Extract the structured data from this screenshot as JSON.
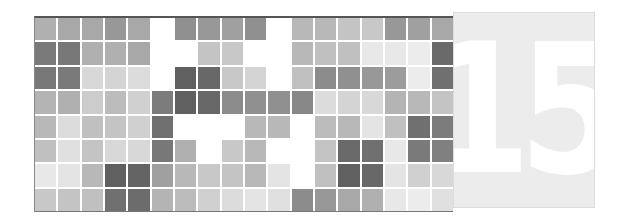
{
  "mosaic": {
    "rows": 8,
    "cols": 18,
    "cells": [
      [
        "#b0b0b0",
        "#a8a8a8",
        "#a8a8a8",
        "#989898",
        "#a8a8a8",
        "#ffffff",
        "#909090",
        "#989898",
        "#a0a0a0",
        "#909090",
        "#ffffff",
        "#b8b8b8",
        "#b8b8b8",
        "#c4c4c4",
        "#c8c8c8",
        "#989898",
        "#a0a0a0",
        "#a8a8a8"
      ],
      [
        "#7a7a7a",
        "#787878",
        "#b0b0b0",
        "#b0b0b0",
        "#a8a8a8",
        "#ffffff",
        "#ffffff",
        "#c4c4c4",
        "#c8c8c8",
        "#ffffff",
        "#ffffff",
        "#b8b8b8",
        "#c0c0c0",
        "#c0c0c0",
        "#e8e8e8",
        "#e8e8e8",
        "#ececec",
        "#6a6a6a"
      ],
      [
        "#787878",
        "#7a7a7a",
        "#d8d8d8",
        "#d4d4d4",
        "#dcdcdc",
        "#ffffff",
        "#606060",
        "#686868",
        "#c8c8c8",
        "#d4d4d4",
        "#ffffff",
        "#c0c0c0",
        "#8c8c8c",
        "#909090",
        "#989898",
        "#9c9c9c",
        "#ececec",
        "#707070"
      ],
      [
        "#b4b4b4",
        "#b0b0b0",
        "#cccccc",
        "#bcbcbc",
        "#d0d0d0",
        "#7c7c7c",
        "#606060",
        "#686868",
        "#8c8c8c",
        "#909090",
        "#909090",
        "#888888",
        "#dcdcdc",
        "#d4d4d4",
        "#d8d8d8",
        "#b4b4b4",
        "#b8b8b8",
        "#c4c4c4"
      ],
      [
        "#b8b8b8",
        "#dcdcdc",
        "#c0c0c0",
        "#c4c4c4",
        "#d0d0d0",
        "#707070",
        "#ffffff",
        "#ffffff",
        "#ffffff",
        "#b8b8b8",
        "#b8b8b8",
        "#ffffff",
        "#bcbcbc",
        "#b8b8b8",
        "#e4e4e4",
        "#c0c0c0",
        "#707070",
        "#7c7c7c"
      ],
      [
        "#c0c0c0",
        "#e0e0e0",
        "#c4c4c4",
        "#d8d8d8",
        "#d8d8d8",
        "#787878",
        "#b0b0b0",
        "#ffffff",
        "#c8c8c8",
        "#b8b8b8",
        "#ffffff",
        "#ffffff",
        "#c4c4c4",
        "#6a6a6a",
        "#707070",
        "#e8e8e8",
        "#7a7a7a",
        "#808080"
      ],
      [
        "#e8e8e8",
        "#e4e4e4",
        "#b8b8b8",
        "#606060",
        "#646464",
        "#a0a0a0",
        "#b8b8b8",
        "#c8c8c8",
        "#c4c4c4",
        "#b8b8b8",
        "#e4e4e4",
        "#ffffff",
        "#c0c0c0",
        "#606060",
        "#686868",
        "#e4e4e4",
        "#d0d0d0",
        "#d8d8d8"
      ],
      [
        "#c8c8c8",
        "#c4c4c4",
        "#c0c0c0",
        "#707070",
        "#6c6c6c",
        "#b4b4b4",
        "#bcbcbc",
        "#d0d0d0",
        "#dcdcdc",
        "#e4e4e4",
        "#e0e0e0",
        "#8c8c8c",
        "#989898",
        "#a8a8a8",
        "#b0b0b0",
        "#e8e8e8",
        "#ececec",
        "#e0e0e0"
      ]
    ]
  },
  "number_panel": {
    "value": "15",
    "background": "#ececec",
    "text_color": "#ffffff"
  }
}
